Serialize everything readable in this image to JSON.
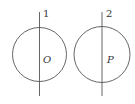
{
  "diagram": {
    "stroke_color": "#555555",
    "figures": [
      {
        "circle": {
          "cx": 39.5,
          "cy": 54.5,
          "r": 27,
          "center_label": "O"
        },
        "line": {
          "x": 39.5,
          "y1": 12,
          "y2": 96,
          "label": "1"
        }
      },
      {
        "circle": {
          "cx": 102,
          "cy": 54.5,
          "r": 28,
          "center_label": "P"
        },
        "line": {
          "x": 102,
          "y1": 12,
          "y2": 96,
          "label": "2"
        }
      }
    ]
  }
}
